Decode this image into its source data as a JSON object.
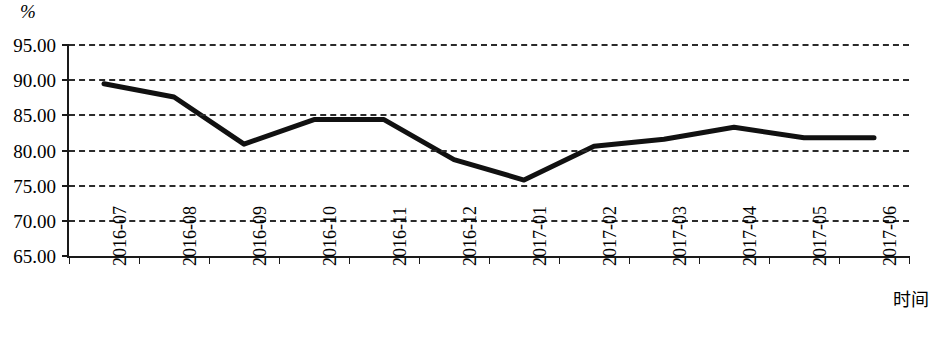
{
  "chart_data": {
    "type": "line",
    "title": "",
    "xlabel": "时间",
    "ylabel": "%",
    "ylim": [
      65,
      95
    ],
    "yticks": [
      "65.00",
      "70.00",
      "75.00",
      "80.00",
      "85.00",
      "90.00",
      "95.00"
    ],
    "ytick_values": [
      65,
      70,
      75,
      80,
      85,
      90,
      95
    ],
    "grid": "horizontal-dashed",
    "legend": "none",
    "line_color": "#111111",
    "categories": [
      "2016-07",
      "2016-08",
      "2016-09",
      "2016-10",
      "2016-11",
      "2016-12",
      "2017-01",
      "2017-02",
      "2017-03",
      "2017-04",
      "2017-05",
      "2017-06"
    ],
    "series": [
      {
        "name": "",
        "values": [
          89.5,
          87.6,
          80.9,
          84.4,
          84.4,
          78.7,
          75.8,
          80.6,
          81.6,
          83.3,
          81.8,
          81.8
        ]
      }
    ]
  }
}
